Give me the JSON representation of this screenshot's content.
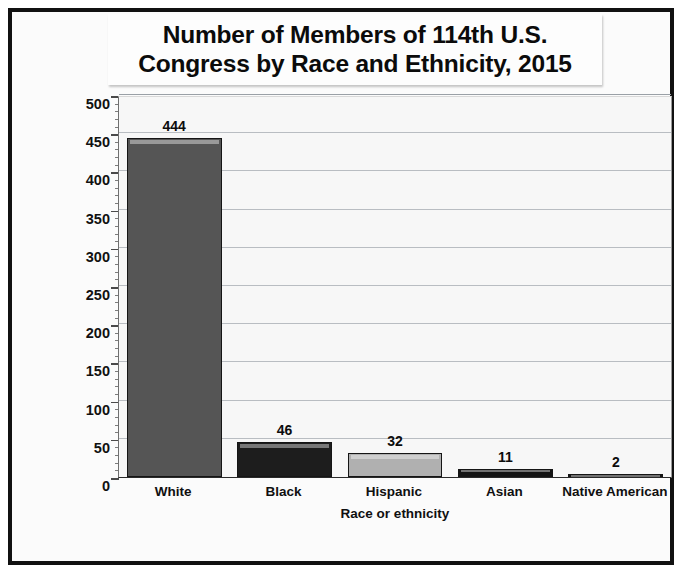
{
  "chart_data": {
    "type": "bar",
    "title": "Number of Members of 114th U.S.\nCongress by Race and Ethnicity, 2015",
    "xlabel": "Race or ethnicity",
    "ylabel": "Number of members",
    "categories": [
      "White",
      "Black",
      "Hispanic",
      "Asian",
      "Native American"
    ],
    "values": [
      444,
      46,
      32,
      11,
      2
    ],
    "value_labels": [
      "444",
      "46",
      "32",
      "11",
      "2"
    ],
    "ylim": [
      0,
      500
    ],
    "ytick_step": 50,
    "yminor_step": 10,
    "yticks": [
      0,
      50,
      100,
      150,
      200,
      250,
      300,
      350,
      400,
      450,
      500
    ],
    "ytick_labels": [
      "0",
      "50",
      "100",
      "150",
      "200",
      "250",
      "300",
      "350",
      "400",
      "450",
      "500"
    ],
    "grid": "horizontal",
    "legend": "none",
    "bar_colors": [
      "#555555",
      "#1d1d1d",
      "#b0b0b0",
      "#141414",
      "#141414"
    ],
    "bar_border_color": "#151515",
    "plot_background": "#f7f7f7",
    "frame_color": "#111111"
  }
}
